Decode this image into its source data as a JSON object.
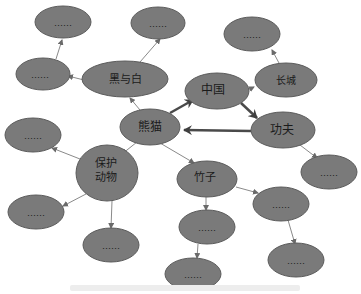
{
  "diagram": {
    "type": "mind-map",
    "node_fill": "#7a7a7a",
    "node_stroke": "#5a5a5a",
    "thin_edge_color": "#8a8a8a",
    "thick_edge_color": "#4a4a4a",
    "nodes": [
      {
        "id": "panda",
        "label": "熊猫",
        "role": "center"
      },
      {
        "id": "china",
        "label": "中国"
      },
      {
        "id": "kungfu",
        "label": "功夫"
      },
      {
        "id": "greatwall",
        "label": "长城"
      },
      {
        "id": "blackwhite",
        "label": "黑与白"
      },
      {
        "id": "protected",
        "label": "保护动物",
        "label_lines": [
          "保护",
          "动物"
        ]
      },
      {
        "id": "bamboo",
        "label": "竹子"
      },
      {
        "id": "p1",
        "label": "……"
      },
      {
        "id": "p2",
        "label": "……"
      },
      {
        "id": "p3",
        "label": "……"
      },
      {
        "id": "p4",
        "label": "……"
      },
      {
        "id": "p5",
        "label": "……"
      },
      {
        "id": "p6",
        "label": "……"
      },
      {
        "id": "p7",
        "label": "……"
      },
      {
        "id": "p8",
        "label": "……"
      },
      {
        "id": "p9",
        "label": "……"
      },
      {
        "id": "p10",
        "label": "……"
      },
      {
        "id": "p11",
        "label": "……"
      },
      {
        "id": "p12",
        "label": "……"
      }
    ],
    "edges": [
      {
        "from": "panda",
        "to": "china",
        "style": "thick"
      },
      {
        "from": "china",
        "to": "kungfu",
        "style": "thick"
      },
      {
        "from": "kungfu",
        "to": "panda",
        "style": "thick"
      },
      {
        "from": "panda",
        "to": "blackwhite",
        "style": "thin"
      },
      {
        "from": "blackwhite",
        "to": "p1",
        "style": "thin"
      },
      {
        "from": "blackwhite",
        "to": "p2",
        "style": "thin"
      },
      {
        "from": "blackwhite",
        "to": "p3",
        "style": "thin"
      },
      {
        "from": "p3",
        "to": "p1",
        "style": "thin"
      },
      {
        "from": "china",
        "to": "greatwall",
        "style": "thin"
      },
      {
        "from": "greatwall",
        "to": "p4",
        "style": "thin"
      },
      {
        "from": "kungfu",
        "to": "p5",
        "style": "thin"
      },
      {
        "from": "panda",
        "to": "protected",
        "style": "thin"
      },
      {
        "from": "protected",
        "to": "p6",
        "style": "thin"
      },
      {
        "from": "protected",
        "to": "p7",
        "style": "thin"
      },
      {
        "from": "protected",
        "to": "p8",
        "style": "thin"
      },
      {
        "from": "panda",
        "to": "bamboo",
        "style": "thin"
      },
      {
        "from": "bamboo",
        "to": "p9",
        "style": "thin"
      },
      {
        "from": "bamboo",
        "to": "p10",
        "style": "thin"
      },
      {
        "from": "p9",
        "to": "p11",
        "style": "thin"
      },
      {
        "from": "p10",
        "to": "p12",
        "style": "thin"
      }
    ],
    "caption": ""
  }
}
